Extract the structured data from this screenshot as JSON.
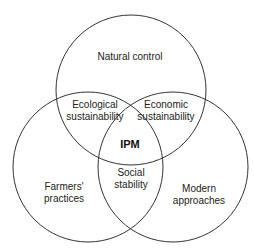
{
  "diagram": {
    "type": "venn",
    "circles": [
      {
        "name": "Natural control",
        "cx": 131,
        "cy": 90,
        "r": 75
      },
      {
        "name": "Farmers' practices",
        "cx": 88,
        "cy": 167,
        "r": 75
      },
      {
        "name": "Modern approaches",
        "cx": 173,
        "cy": 167,
        "r": 75
      }
    ],
    "labels": {
      "natural_control": "Natural control",
      "ecological_1": "Ecological",
      "ecological_2": "sustainability",
      "economic_1": "Economic",
      "economic_2": "sustainability",
      "center": "IPM",
      "social_1": "Social",
      "social_2": "stability",
      "farmers_1": "Farmers'",
      "farmers_2": "practices",
      "modern_1": "Modern",
      "modern_2": "approaches"
    },
    "stroke_color": "#333333",
    "background": "#ffffff"
  }
}
